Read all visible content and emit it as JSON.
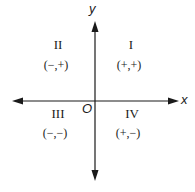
{
  "diagram": {
    "axes": {
      "x_label": "x",
      "y_label": "y",
      "origin_label": "O"
    },
    "quadrants": [
      {
        "name": "I",
        "signs": "(+,+)"
      },
      {
        "name": "II",
        "signs": "(−,+)"
      },
      {
        "name": "III",
        "signs": "(−,−)"
      },
      {
        "name": "IV",
        "signs": "(+,−)"
      }
    ],
    "colors": {
      "ink": "#1a1a1a",
      "background": "#ffffff"
    }
  }
}
